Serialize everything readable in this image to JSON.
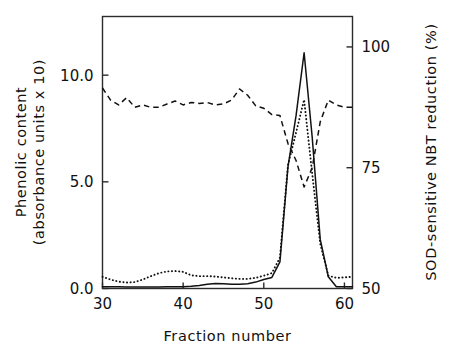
{
  "chart_data": {
    "type": "line",
    "title": "",
    "xlabel": "Fraction number",
    "ylabel": "Phenolic content (absorbance units x 10)",
    "y2label": "SOD-sensitive NBT reduction (%)",
    "ylabel_line1": "Phenolic content",
    "ylabel_line2": "(absorbance units x 10)",
    "xlim": [
      30,
      61
    ],
    "ylim": [
      0.0,
      12.75
    ],
    "y2lim": [
      50,
      106.3
    ],
    "grid": false,
    "legend": "none",
    "xticks": [
      30,
      40,
      50,
      60
    ],
    "xtick_labels": [
      "30",
      "40",
      "50",
      "60"
    ],
    "yticks": [
      0.0,
      5.0,
      10.0
    ],
    "ytick_labels": [
      "0.0",
      "5.0",
      "10.0"
    ],
    "y2ticks": [
      50,
      75,
      100
    ],
    "y2tick_labels": [
      "50",
      "75",
      "100"
    ],
    "colors": {
      "axis": "#2b2b2b",
      "solid_series": "#111111",
      "dotted_series": "#111111",
      "dashed_series": "#111111"
    },
    "series": [
      {
        "name": "Phenolic content (solid)",
        "axis": "left",
        "style": "solid",
        "x": [
          30,
          31,
          32,
          33,
          34,
          35,
          36,
          37,
          38,
          39,
          40,
          41,
          42,
          43,
          44,
          45,
          46,
          47,
          48,
          49,
          50,
          51,
          52,
          53,
          54,
          55,
          56,
          57,
          58,
          59,
          60,
          61
        ],
        "values": [
          0.08,
          0.08,
          0.08,
          0.07,
          0.07,
          0.07,
          0.07,
          0.07,
          0.08,
          0.08,
          0.08,
          0.1,
          0.14,
          0.2,
          0.24,
          0.22,
          0.2,
          0.2,
          0.22,
          0.3,
          0.42,
          0.52,
          1.25,
          5.7,
          8.1,
          11.05,
          7.1,
          2.3,
          0.55,
          0.08,
          0.08,
          0.08
        ]
      },
      {
        "name": "Phenolic content (dotted)",
        "axis": "left",
        "style": "dotted",
        "x": [
          30,
          31,
          32,
          33,
          34,
          35,
          36,
          37,
          38,
          39,
          40,
          41,
          42,
          43,
          44,
          45,
          46,
          47,
          48,
          49,
          50,
          51,
          52,
          53,
          54,
          55,
          56,
          57,
          58,
          59,
          60,
          61
        ],
        "values": [
          0.55,
          0.42,
          0.32,
          0.28,
          0.3,
          0.42,
          0.58,
          0.72,
          0.8,
          0.82,
          0.78,
          0.62,
          0.58,
          0.58,
          0.56,
          0.52,
          0.48,
          0.45,
          0.45,
          0.5,
          0.6,
          0.72,
          1.45,
          5.8,
          7.3,
          8.85,
          5.4,
          2.1,
          0.6,
          0.5,
          0.52,
          0.55
        ]
      },
      {
        "name": "SOD-sensitive NBT reduction (dashed)",
        "axis": "right",
        "style": "dashed",
        "x": [
          30,
          31,
          32,
          33,
          34,
          35,
          36,
          37,
          38,
          39,
          40,
          41,
          42,
          43,
          44,
          45,
          46,
          47,
          48,
          49,
          50,
          51,
          52,
          53,
          54,
          55,
          56,
          57,
          58,
          59,
          60,
          61
        ],
        "values": [
          91.5,
          89.0,
          88.0,
          89.5,
          87.5,
          88.0,
          87.5,
          87.5,
          88.2,
          88.8,
          88.0,
          88.5,
          88.3,
          88.5,
          88.0,
          88.2,
          89.0,
          91.3,
          90.0,
          87.8,
          87.3,
          86.0,
          85.8,
          80.0,
          76.5,
          71.0,
          75.0,
          84.5,
          89.0,
          88.0,
          87.5,
          87.5
        ]
      }
    ]
  },
  "axes": {
    "x_title": "Fraction number",
    "y_left_title_line1": "Phenolic content",
    "y_left_title_line2": "(absorbance units x 10)",
    "y_right_title": "SOD-sensitive NBT reduction (%)"
  }
}
